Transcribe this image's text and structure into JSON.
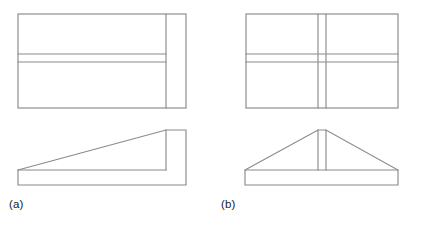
{
  "figure": {
    "width": 421,
    "height": 225,
    "background_color": "#ffffff",
    "line_color": "#8a8a8a",
    "line_width": 1.15,
    "text_color": "#1a1a1a"
  },
  "parts": [
    {
      "id": "a",
      "caption": "(a)",
      "description": "Single-slope wedge block with vertical back wall",
      "views": [
        {
          "name": "top-view",
          "shape": "rectangle",
          "outline": {
            "x": 18,
            "y": 14,
            "width": 168,
            "height": 94
          },
          "internal_lines": [
            {
              "type": "horizontal",
              "y": 54,
              "x_start": 18,
              "x_end": 166
            },
            {
              "type": "horizontal",
              "y": 62,
              "x_start": 18,
              "x_end": 166
            },
            {
              "type": "vertical",
              "x": 166,
              "y_start": 14,
              "y_end": 108
            }
          ]
        },
        {
          "name": "front-view",
          "shape": "wedge-profile",
          "outline_points": "18,170 166,130 186,130 186,185 18,185",
          "internal_lines": [
            {
              "type": "vertical",
              "x": 166,
              "y_start": 130,
              "y_end": 170
            },
            {
              "type": "horizontal",
              "y": 170,
              "x_start": 18,
              "x_end": 166
            }
          ]
        }
      ]
    },
    {
      "id": "b",
      "caption": "(b)",
      "description": "Symmetric double-slope block with central vertical rib",
      "views": [
        {
          "name": "top-view",
          "shape": "rectangle",
          "outline": {
            "x": 246,
            "y": 14,
            "width": 152,
            "height": 94
          },
          "internal_lines": [
            {
              "type": "horizontal",
              "y": 54,
              "x_start": 246,
              "x_end": 398
            },
            {
              "type": "horizontal",
              "y": 62,
              "x_start": 246,
              "x_end": 398
            },
            {
              "type": "vertical",
              "x": 318,
              "y_start": 14,
              "y_end": 108
            },
            {
              "type": "vertical",
              "x": 326,
              "y_start": 14,
              "y_end": 108
            }
          ]
        },
        {
          "name": "front-view",
          "shape": "pyramid-profile",
          "outline_points": "245,170 318,130 326,130 398,170 398,185 245,185",
          "internal_lines": [
            {
              "type": "vertical",
              "x": 318,
              "y_start": 130,
              "y_end": 170
            },
            {
              "type": "vertical",
              "x": 326,
              "y_start": 130,
              "y_end": 170
            },
            {
              "type": "horizontal",
              "y": 170,
              "x_start": 245,
              "x_end": 398
            }
          ]
        }
      ]
    }
  ]
}
